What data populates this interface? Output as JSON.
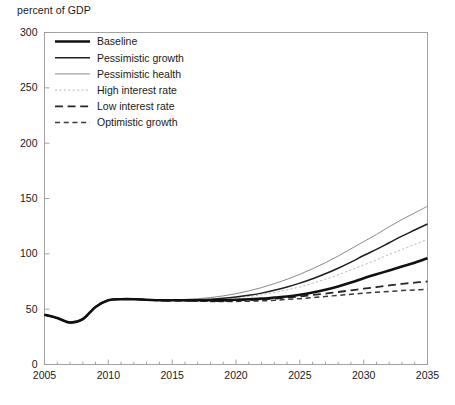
{
  "chart_data": {
    "type": "line",
    "title": "percent of GDP",
    "xlabel": "",
    "ylabel": "percent of GDP",
    "xlim": [
      2005,
      2035
    ],
    "ylim": [
      0,
      300
    ],
    "ytick_values": [
      0,
      50,
      100,
      150,
      200,
      250,
      300
    ],
    "ytick_labels": [
      "0",
      "50",
      "100",
      "150",
      "200",
      "250",
      "300"
    ],
    "xtick_values": [
      2005,
      2010,
      2015,
      2020,
      2025,
      2030,
      2035
    ],
    "xtick_labels": [
      "2005",
      "2010",
      "2015",
      "2020",
      "2025",
      "2030",
      "2035"
    ],
    "minor_xtick_step": 1,
    "grid": false,
    "legend_position": "top-left",
    "x": [
      2005,
      2006,
      2007,
      2008,
      2009,
      2010,
      2011,
      2012,
      2013,
      2014,
      2015,
      2016,
      2017,
      2018,
      2019,
      2020,
      2021,
      2022,
      2023,
      2024,
      2025,
      2026,
      2027,
      2028,
      2029,
      2030,
      2031,
      2032,
      2033,
      2034,
      2035
    ],
    "series": [
      {
        "name": "Baseline",
        "style": "solid",
        "width": 2.6,
        "color": "#111111",
        "values": [
          45,
          42,
          38,
          41,
          52,
          58,
          59,
          59,
          58.5,
          58,
          58,
          58,
          58,
          58,
          58,
          58.5,
          59,
          59.5,
          60.5,
          61.5,
          63,
          65,
          67.5,
          70.5,
          74,
          78,
          81.5,
          85,
          88.5,
          92,
          96
        ]
      },
      {
        "name": "Pessimistic growth",
        "style": "solid",
        "width": 1.5,
        "color": "#1f1f1f",
        "values": [
          45,
          42,
          38,
          41,
          52,
          58,
          59,
          59,
          58.5,
          58,
          58,
          58.2,
          58.5,
          59,
          59.8,
          61,
          62.5,
          64.5,
          67,
          70,
          73.5,
          77.5,
          82,
          87,
          92.5,
          98.5,
          104,
          110,
          116,
          121.5,
          127
        ]
      },
      {
        "name": "Pessimistic health",
        "style": "solid",
        "width": 1.0,
        "color": "#8a8a8a",
        "values": [
          45,
          42,
          38,
          41,
          52,
          58,
          59,
          59,
          58.5,
          58,
          58.2,
          58.8,
          59.5,
          60.5,
          62,
          64,
          66.5,
          69.5,
          73,
          77,
          81.5,
          86.5,
          92,
          98,
          104.5,
          111,
          117.5,
          124.5,
          131,
          137,
          143
        ]
      },
      {
        "name": "High interest rate",
        "style": "dotted",
        "width": 1.0,
        "color": "#b8b8b8",
        "values": [
          45,
          42,
          38,
          41,
          52,
          58,
          59,
          59,
          58.5,
          58,
          58,
          58.2,
          58.5,
          59,
          59.5,
          60.5,
          61.5,
          63,
          65,
          67.5,
          70,
          73.5,
          77,
          81,
          85.5,
          90,
          94.5,
          99.5,
          104,
          108.5,
          113
        ]
      },
      {
        "name": "Low interest rate",
        "style": "longdash",
        "width": 1.8,
        "color": "#262626",
        "values": [
          45,
          42,
          38,
          41,
          52,
          58,
          59,
          59,
          58.5,
          58,
          57.8,
          57.6,
          57.5,
          57.5,
          57.6,
          57.8,
          58.2,
          58.8,
          59.5,
          60.5,
          61.5,
          62.8,
          64,
          65.5,
          67,
          68.5,
          70,
          71.5,
          72.8,
          74,
          75
        ]
      },
      {
        "name": "Optimistic growth",
        "style": "dash",
        "width": 1.5,
        "color": "#3a3a3a",
        "values": [
          45,
          42,
          38,
          41,
          52,
          58,
          59,
          59,
          58.5,
          58,
          57.8,
          57.5,
          57.2,
          57,
          57,
          57,
          57.2,
          57.5,
          58,
          58.8,
          59.5,
          60.5,
          61.5,
          62.5,
          63.5,
          64.5,
          65.3,
          66,
          66.8,
          67.4,
          68
        ]
      }
    ]
  },
  "legend": {
    "items": [
      {
        "label": "Baseline"
      },
      {
        "label": "Pessimistic growth"
      },
      {
        "label": "Pessimistic health"
      },
      {
        "label": "High interest rate"
      },
      {
        "label": "Low interest rate"
      },
      {
        "label": "Optimistic growth"
      }
    ]
  }
}
